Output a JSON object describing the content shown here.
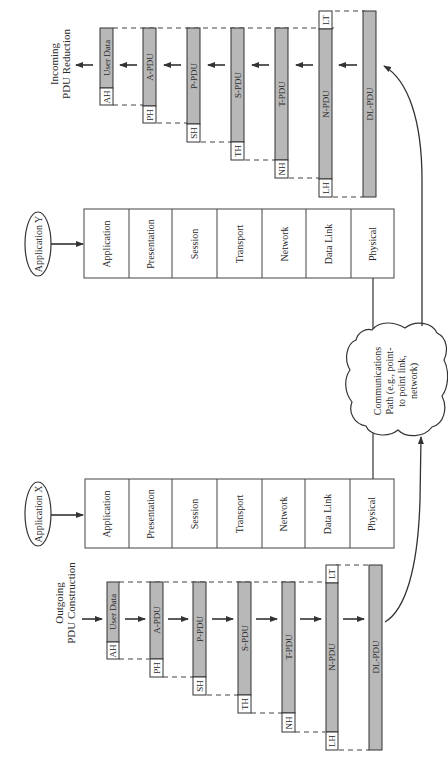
{
  "colors": {
    "pdu_fill": "#b8b8b8",
    "stroke": "#333333",
    "background": "#ffffff"
  },
  "incoming": {
    "title_line1": "Incoming",
    "title_line2": "PDU Reduction",
    "pdus": [
      {
        "header": "AH",
        "label": "User Data",
        "trailer": ""
      },
      {
        "header": "PH",
        "label": "A-PDU",
        "trailer": ""
      },
      {
        "header": "SH",
        "label": "P-PDU",
        "trailer": ""
      },
      {
        "header": "TH",
        "label": "S-PDU",
        "trailer": ""
      },
      {
        "header": "NH",
        "label": "T-PDU",
        "trailer": ""
      },
      {
        "header": "LH",
        "label": "N-PDU",
        "trailer": "LT"
      },
      {
        "header": "",
        "label": "DL-PDU",
        "trailer": ""
      }
    ]
  },
  "outgoing": {
    "title_line1": "Outgoing",
    "title_line2": "PDU Construction",
    "pdus": [
      {
        "header": "AH",
        "label": "User Data",
        "trailer": ""
      },
      {
        "header": "PH",
        "label": "A-PDU",
        "trailer": ""
      },
      {
        "header": "SH",
        "label": "P-PDU",
        "trailer": ""
      },
      {
        "header": "TH",
        "label": "S-PDU",
        "trailer": ""
      },
      {
        "header": "NH",
        "label": "T-PDU",
        "trailer": ""
      },
      {
        "header": "LH",
        "label": "N-PDU",
        "trailer": "LT"
      },
      {
        "header": "",
        "label": "DL-PDU",
        "trailer": ""
      }
    ]
  },
  "app_y": {
    "label": "Application Y",
    "layers": [
      "Application",
      "Presentation",
      "Session",
      "Transport",
      "Network",
      "Data Link",
      "Physical"
    ]
  },
  "app_x": {
    "label": "Application X",
    "layers": [
      "Application",
      "Presentation",
      "Session",
      "Transport",
      "Network",
      "Data Link",
      "Physical"
    ]
  },
  "cloud": {
    "line1": "Communications",
    "line2": "Path (e.g., point-",
    "line3": "to point link,",
    "line4": "network)"
  }
}
